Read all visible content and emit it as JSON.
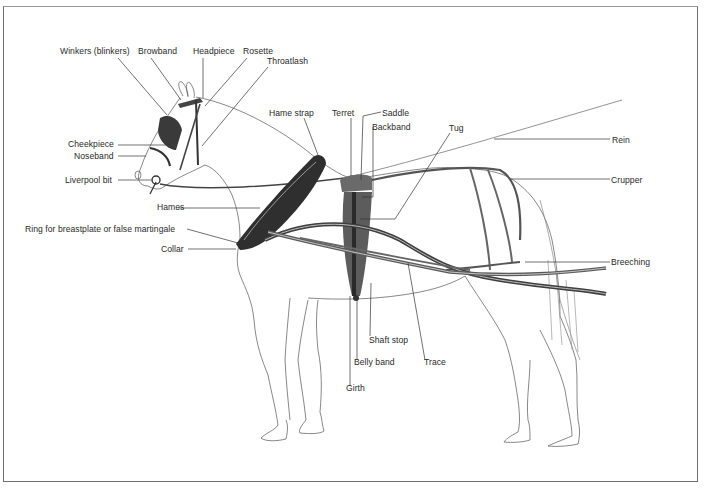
{
  "diagram": {
    "labels": {
      "winkers": "Winkers (blinkers)",
      "browband": "Browband",
      "headpiece": "Headpiece",
      "rosette": "Rosette",
      "throatlash": "Throatlash",
      "cheekpiece": "Cheekpiece",
      "noseband": "Noseband",
      "liverpool_bit": "Liverpool bit",
      "hame_strap": "Hame strap",
      "hames": "Hames",
      "ring": "Ring for breastplate or false martingale",
      "collar": "Collar",
      "terret": "Terret",
      "saddle": "Saddle",
      "backband": "Backband",
      "tug": "Tug",
      "rein": "Rein",
      "crupper": "Crupper",
      "breeching": "Breeching",
      "shaft_stop": "Shaft stop",
      "belly_band": "Belly band",
      "trace": "Trace",
      "girth": "Girth"
    }
  }
}
